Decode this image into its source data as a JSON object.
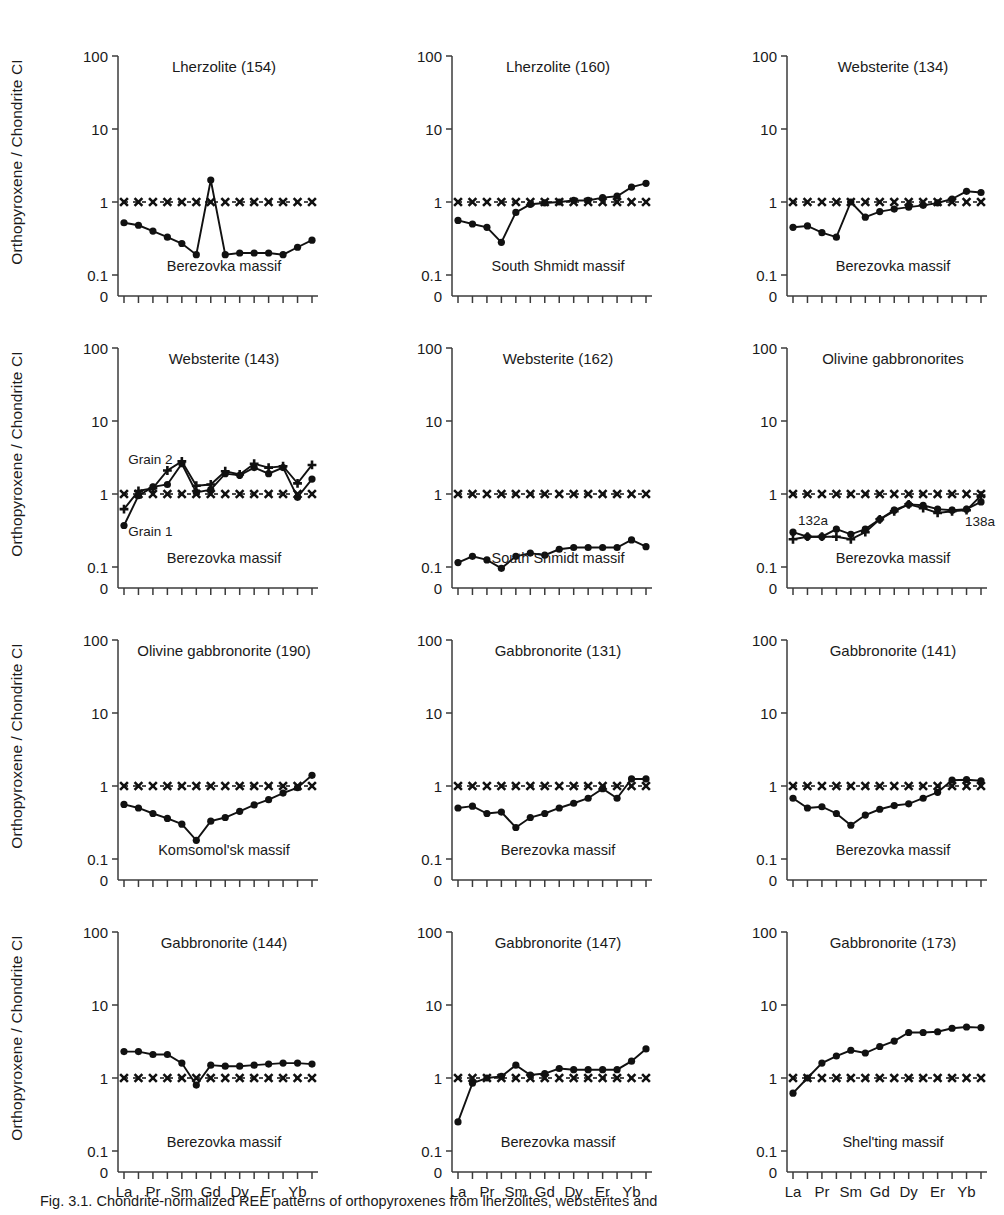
{
  "figure": {
    "y_axis_label": "Orthopyroxene / Chondrite CI",
    "y_ticks": [
      "100",
      "10",
      "1",
      "0.1",
      "0"
    ],
    "x_elements_top": [
      "La",
      "Pr",
      "Sm",
      "Gd",
      "Dy",
      "Er",
      "Yb"
    ],
    "x_elements_bottom": [
      "Ce",
      "Nd",
      "Eu",
      "Tb",
      "Ho",
      "Tm",
      "Lu"
    ],
    "caption": "Fig. 3.1. Chondrite-normalized REE patterns of orthopyroxenes from lherzolites, websterites and",
    "reference_series_name": "chondrite-normalized reference line",
    "colors": {
      "line": "#111111",
      "marker": "#111111",
      "axis": "#3b3b3b",
      "background": "#ffffff"
    }
  },
  "chart_data": [
    {
      "type": "line",
      "panel": 1,
      "title": "Lherzolite (154)",
      "massif": "Berezovka massif",
      "ylabel": "Orthopyroxene / Chondrite CI",
      "xlabel": "",
      "ylim": [
        0.1,
        100
      ],
      "yscale": "log",
      "ytick_values": [
        100,
        10,
        1,
        0.1
      ],
      "categories": [
        "La",
        "Ce",
        "Pr",
        "Nd",
        "Sm",
        "Eu",
        "Gd",
        "Tb",
        "Dy",
        "Ho",
        "Er",
        "Tm",
        "Yb",
        "Lu"
      ],
      "series": [
        {
          "name": "sample",
          "marker": "circle",
          "values": [
            0.52,
            0.48,
            0.4,
            0.33,
            0.27,
            0.19,
            2.0,
            0.19,
            0.2,
            0.2,
            0.2,
            0.19,
            0.24,
            0.3
          ]
        },
        {
          "name": "reference",
          "marker": "cross",
          "style": "dashed",
          "values": [
            1,
            1,
            1,
            1,
            1,
            1,
            1,
            1,
            1,
            1,
            1,
            1,
            1,
            1
          ]
        }
      ]
    },
    {
      "type": "line",
      "panel": 2,
      "title": "Lherzolite (160)",
      "massif": "South Shmidt massif",
      "ylabel": "Orthopyroxene / Chondrite CI",
      "xlabel": "",
      "ylim": [
        0.1,
        100
      ],
      "yscale": "log",
      "ytick_values": [
        100,
        10,
        1,
        0.1
      ],
      "categories": [
        "La",
        "Ce",
        "Pr",
        "Nd",
        "Sm",
        "Eu",
        "Gd",
        "Tb",
        "Dy",
        "Ho",
        "Er",
        "Tm",
        "Yb",
        "Lu"
      ],
      "series": [
        {
          "name": "sample",
          "marker": "circle",
          "values": [
            0.56,
            0.5,
            0.45,
            0.28,
            0.72,
            0.93,
            0.97,
            1.0,
            1.05,
            1.05,
            1.15,
            1.2,
            1.6,
            1.8
          ]
        },
        {
          "name": "reference",
          "marker": "cross",
          "style": "dashed",
          "values": [
            1,
            1,
            1,
            1,
            1,
            1,
            1,
            1,
            1,
            1,
            1,
            1,
            1,
            1
          ]
        }
      ]
    },
    {
      "type": "line",
      "panel": 3,
      "title": "Websterite (134)",
      "massif": "Berezovka massif",
      "ylabel": "Orthopyroxene / Chondrite CI",
      "xlabel": "",
      "ylim": [
        0.1,
        100
      ],
      "yscale": "log",
      "ytick_values": [
        100,
        10,
        1,
        0.1
      ],
      "categories": [
        "La",
        "Ce",
        "Pr",
        "Nd",
        "Sm",
        "Eu",
        "Gd",
        "Tb",
        "Dy",
        "Ho",
        "Er",
        "Tm",
        "Yb",
        "Lu"
      ],
      "series": [
        {
          "name": "sample",
          "marker": "circle",
          "values": [
            0.45,
            0.47,
            0.38,
            0.33,
            1.0,
            0.62,
            0.74,
            0.8,
            0.85,
            0.9,
            0.97,
            1.1,
            1.4,
            1.35
          ]
        },
        {
          "name": "reference",
          "marker": "cross",
          "style": "dashed",
          "values": [
            1,
            1,
            1,
            1,
            1,
            1,
            1,
            1,
            1,
            1,
            1,
            1,
            1,
            1
          ]
        }
      ]
    },
    {
      "type": "line",
      "panel": 4,
      "title": "Websterite (143)",
      "massif": "Berezovka massif",
      "ylabel": "Orthopyroxene / Chondrite CI",
      "xlabel": "",
      "ylim": [
        0.1,
        100
      ],
      "yscale": "log",
      "ytick_values": [
        100,
        10,
        1,
        0.1
      ],
      "annotations": [
        {
          "text": "Grain 2",
          "x_index": 0.3,
          "y_value": 2.6
        },
        {
          "text": "Grain 1",
          "x_index": 0.3,
          "y_value": 0.27
        }
      ],
      "categories": [
        "La",
        "Ce",
        "Pr",
        "Nd",
        "Sm",
        "Eu",
        "Gd",
        "Tb",
        "Dy",
        "Ho",
        "Er",
        "Tm",
        "Yb",
        "Lu"
      ],
      "series": [
        {
          "name": "Grain 1",
          "marker": "circle",
          "values": [
            0.37,
            0.95,
            1.25,
            1.35,
            2.6,
            1.05,
            1.15,
            1.9,
            1.8,
            2.3,
            1.9,
            2.3,
            0.9,
            1.6
          ]
        },
        {
          "name": "Grain 2",
          "marker": "plus",
          "values": [
            0.62,
            1.1,
            1.2,
            2.1,
            2.8,
            1.3,
            1.35,
            2.05,
            1.85,
            2.6,
            2.3,
            2.4,
            1.4,
            2.5
          ]
        },
        {
          "name": "reference",
          "marker": "cross",
          "style": "dashed",
          "values": [
            1,
            1,
            1,
            1,
            1,
            1,
            1,
            1,
            1,
            1,
            1,
            1,
            1,
            1
          ]
        }
      ]
    },
    {
      "type": "line",
      "panel": 5,
      "title": "Websterite (162)",
      "massif": "South Shmidt massif",
      "ylabel": "Orthopyroxene / Chondrite CI",
      "xlabel": "",
      "ylim": [
        0.1,
        100
      ],
      "yscale": "log",
      "ytick_values": [
        100,
        10,
        1,
        0.1
      ],
      "categories": [
        "La",
        "Ce",
        "Pr",
        "Nd",
        "Sm",
        "Eu",
        "Gd",
        "Tb",
        "Dy",
        "Ho",
        "Er",
        "Tm",
        "Yb",
        "Lu"
      ],
      "series": [
        {
          "name": "sample",
          "marker": "circle",
          "values": [
            0.115,
            0.14,
            0.125,
            0.096,
            0.14,
            0.155,
            0.145,
            0.175,
            0.185,
            0.185,
            0.185,
            0.185,
            0.235,
            0.19
          ]
        },
        {
          "name": "reference",
          "marker": "cross",
          "style": "dashed",
          "values": [
            1,
            1,
            1,
            1,
            1,
            1,
            1,
            1,
            1,
            1,
            1,
            1,
            1,
            1
          ]
        }
      ]
    },
    {
      "type": "line",
      "panel": 6,
      "title": "Olivine gabbronorites",
      "massif": "Berezovka massif",
      "ylabel": "Orthopyroxene / Chondrite CI",
      "xlabel": "",
      "ylim": [
        0.1,
        100
      ],
      "yscale": "log",
      "ytick_values": [
        100,
        10,
        1,
        0.1
      ],
      "annotations": [
        {
          "text": "132a",
          "x_index": 0.35,
          "y_value": 0.38
        },
        {
          "text": "138a",
          "x_index": 11.9,
          "y_value": 0.37
        }
      ],
      "categories": [
        "La",
        "Ce",
        "Pr",
        "Nd",
        "Sm",
        "Eu",
        "Gd",
        "Tb",
        "Dy",
        "Ho",
        "Er",
        "Tm",
        "Yb",
        "Lu"
      ],
      "series": [
        {
          "name": "132a",
          "marker": "circle",
          "values": [
            0.3,
            0.26,
            0.26,
            0.33,
            0.28,
            0.33,
            0.45,
            0.6,
            0.72,
            0.7,
            0.62,
            0.6,
            0.62,
            0.78
          ]
        },
        {
          "name": "138a",
          "marker": "plus",
          "values": [
            0.24,
            0.26,
            0.26,
            0.26,
            0.24,
            0.3,
            0.45,
            0.58,
            0.72,
            0.64,
            0.55,
            0.58,
            0.6,
            0.95
          ]
        },
        {
          "name": "reference",
          "marker": "cross",
          "style": "dashed",
          "values": [
            1,
            1,
            1,
            1,
            1,
            1,
            1,
            1,
            1,
            1,
            1,
            1,
            1,
            1
          ]
        }
      ]
    },
    {
      "type": "line",
      "panel": 7,
      "title": "Olivine gabbronorite (190)",
      "massif": "Komsomol'sk massif",
      "ylabel": "Orthopyroxene / Chondrite CI",
      "xlabel": "",
      "ylim": [
        0.1,
        100
      ],
      "yscale": "log",
      "ytick_values": [
        100,
        10,
        1,
        0.1
      ],
      "categories": [
        "La",
        "Ce",
        "Pr",
        "Nd",
        "Sm",
        "Eu",
        "Gd",
        "Tb",
        "Dy",
        "Ho",
        "Er",
        "Tm",
        "Yb",
        "Lu"
      ],
      "series": [
        {
          "name": "sample",
          "marker": "circle",
          "values": [
            0.56,
            0.5,
            0.42,
            0.36,
            0.3,
            0.18,
            0.33,
            0.37,
            0.45,
            0.55,
            0.65,
            0.8,
            0.95,
            1.4
          ]
        },
        {
          "name": "reference",
          "marker": "cross",
          "style": "dashed",
          "values": [
            1,
            1,
            1,
            1,
            1,
            1,
            1,
            1,
            1,
            1,
            1,
            1,
            1,
            1
          ]
        }
      ]
    },
    {
      "type": "line",
      "panel": 8,
      "title": "Gabbronorite (131)",
      "massif": "Berezovka massif",
      "ylabel": "Orthopyroxene / Chondrite CI",
      "xlabel": "",
      "ylim": [
        0.1,
        100
      ],
      "yscale": "log",
      "ytick_values": [
        100,
        10,
        1,
        0.1
      ],
      "categories": [
        "La",
        "Ce",
        "Pr",
        "Nd",
        "Sm",
        "Eu",
        "Gd",
        "Tb",
        "Dy",
        "Ho",
        "Er",
        "Tm",
        "Yb",
        "Lu"
      ],
      "series": [
        {
          "name": "sample",
          "marker": "circle",
          "values": [
            0.5,
            0.53,
            0.42,
            0.44,
            0.27,
            0.37,
            0.42,
            0.5,
            0.58,
            0.68,
            0.92,
            0.68,
            1.25,
            1.25
          ]
        },
        {
          "name": "reference",
          "marker": "cross",
          "style": "dashed",
          "values": [
            1,
            1,
            1,
            1,
            1,
            1,
            1,
            1,
            1,
            1,
            1,
            1,
            1,
            1
          ]
        }
      ]
    },
    {
      "type": "line",
      "panel": 9,
      "title": "Gabbronorite (141)",
      "massif": "Berezovka massif",
      "ylabel": "Orthopyroxene / Chondrite CI",
      "xlabel": "",
      "ylim": [
        0.1,
        100
      ],
      "yscale": "log",
      "ytick_values": [
        100,
        10,
        1,
        0.1
      ],
      "categories": [
        "La",
        "Ce",
        "Pr",
        "Nd",
        "Sm",
        "Eu",
        "Gd",
        "Tb",
        "Dy",
        "Ho",
        "Er",
        "Tm",
        "Yb",
        "Lu"
      ],
      "series": [
        {
          "name": "sample",
          "marker": "circle",
          "values": [
            0.68,
            0.5,
            0.52,
            0.42,
            0.29,
            0.4,
            0.48,
            0.54,
            0.57,
            0.68,
            0.82,
            1.2,
            1.22,
            1.18
          ]
        },
        {
          "name": "reference",
          "marker": "cross",
          "style": "dashed",
          "values": [
            1,
            1,
            1,
            1,
            1,
            1,
            1,
            1,
            1,
            1,
            1,
            1,
            1,
            1
          ]
        }
      ]
    },
    {
      "type": "line",
      "panel": 10,
      "title": "Gabbronorite (144)",
      "massif": "Berezovka massif",
      "ylabel": "Orthopyroxene / Chondrite CI",
      "xlabel": "",
      "ylim": [
        0.1,
        100
      ],
      "yscale": "log",
      "ytick_values": [
        100,
        10,
        1,
        0.1
      ],
      "categories": [
        "La",
        "Ce",
        "Pr",
        "Nd",
        "Sm",
        "Eu",
        "Gd",
        "Tb",
        "Dy",
        "Ho",
        "Er",
        "Tm",
        "Yb",
        "Lu"
      ],
      "series": [
        {
          "name": "sample",
          "marker": "circle",
          "values": [
            2.3,
            2.3,
            2.1,
            2.1,
            1.6,
            0.8,
            1.5,
            1.45,
            1.45,
            1.5,
            1.55,
            1.6,
            1.6,
            1.55
          ]
        },
        {
          "name": "reference",
          "marker": "cross",
          "style": "dashed",
          "values": [
            1,
            1,
            1,
            1,
            1,
            1,
            1,
            1,
            1,
            1,
            1,
            1,
            1,
            1
          ]
        }
      ]
    },
    {
      "type": "line",
      "panel": 11,
      "title": "Gabbronorite (147)",
      "massif": "Berezovka massif",
      "ylabel": "Orthopyroxene / Chondrite CI",
      "xlabel": "",
      "ylim": [
        0.1,
        100
      ],
      "yscale": "log",
      "ytick_values": [
        100,
        10,
        1,
        0.1
      ],
      "categories": [
        "La",
        "Ce",
        "Pr",
        "Nd",
        "Sm",
        "Eu",
        "Gd",
        "Tb",
        "Dy",
        "Ho",
        "Er",
        "Tm",
        "Yb",
        "Lu"
      ],
      "series": [
        {
          "name": "sample",
          "marker": "circle",
          "values": [
            0.25,
            0.85,
            1.0,
            1.05,
            1.5,
            1.1,
            1.15,
            1.35,
            1.3,
            1.3,
            1.3,
            1.3,
            1.7,
            2.5
          ]
        },
        {
          "name": "reference",
          "marker": "cross",
          "style": "dashed",
          "values": [
            1,
            1,
            1,
            1,
            1,
            1,
            1,
            1,
            1,
            1,
            1,
            1,
            1,
            1
          ]
        }
      ]
    },
    {
      "type": "line",
      "panel": 12,
      "title": "Gabbronorite (173)",
      "massif": "Shel'ting massif",
      "ylabel": "Orthopyroxene / Chondrite CI",
      "xlabel": "",
      "ylim": [
        0.1,
        100
      ],
      "yscale": "log",
      "ytick_values": [
        100,
        10,
        1,
        0.1
      ],
      "categories": [
        "La",
        "Ce",
        "Pr",
        "Nd",
        "Sm",
        "Eu",
        "Gd",
        "Tb",
        "Dy",
        "Ho",
        "Er",
        "Tm",
        "Yb",
        "Lu"
      ],
      "series": [
        {
          "name": "sample",
          "marker": "circle",
          "values": [
            0.62,
            1.0,
            1.6,
            2.0,
            2.4,
            2.2,
            2.7,
            3.2,
            4.2,
            4.2,
            4.3,
            4.8,
            5.0,
            4.9
          ]
        },
        {
          "name": "reference",
          "marker": "cross",
          "style": "dashed",
          "values": [
            1,
            1,
            1,
            1,
            1,
            1,
            1,
            1,
            1,
            1,
            1,
            1,
            1,
            1
          ]
        }
      ]
    }
  ]
}
